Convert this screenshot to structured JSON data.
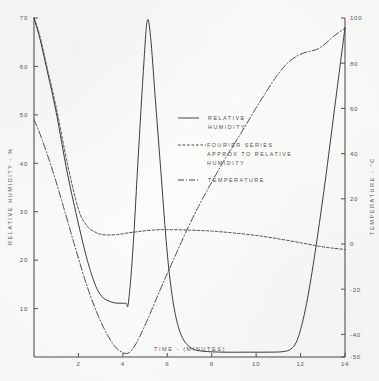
{
  "chart_data": {
    "type": "line",
    "title": "",
    "xlabel": "TIME - (MINUTES)",
    "ylabel": "RELATIVE HUMIDITY - %",
    "y2label": "TEMPERATURE - °C",
    "xlim": [
      0,
      14
    ],
    "ylim": [
      0,
      70
    ],
    "y2lim": [
      -50,
      100
    ],
    "grid": false,
    "legend_position": "center",
    "xticks": [
      2,
      4,
      6,
      8,
      10,
      12,
      14
    ],
    "xticklabels": [
      "2",
      "4",
      "6",
      "8",
      "10",
      "12",
      "14"
    ],
    "yticks": [
      10,
      20,
      30,
      40,
      50,
      60,
      70
    ],
    "yticklabels": [
      "10",
      "20",
      "30",
      "40",
      "50",
      "60",
      "70"
    ],
    "y2ticks": [
      -50,
      -40,
      -20,
      0,
      20,
      40,
      60,
      80,
      100
    ],
    "y2ticklabels": [
      "-50",
      "-40",
      "-20",
      "0",
      "20",
      "40",
      "60",
      "80",
      "100"
    ],
    "series": [
      {
        "name": "RELATIVE HUMIDITY",
        "style": "solid",
        "axis": "left",
        "x": [
          0.0,
          0.25,
          0.6,
          1.0,
          1.5,
          2.0,
          2.4,
          2.75,
          3.0,
          3.25,
          3.6,
          3.95,
          4.15,
          4.25,
          4.45,
          4.7,
          4.95,
          5.1,
          5.25,
          5.45,
          5.7,
          5.95,
          6.15,
          6.4,
          6.7,
          7.1,
          7.6,
          8.5,
          9.5,
          10.5,
          11.2,
          11.55,
          11.8,
          12.05,
          12.35,
          12.7,
          13.1,
          13.55,
          14.0
        ],
        "y": [
          70.0,
          66.0,
          59.0,
          50.5,
          38.0,
          27.5,
          20.0,
          15.0,
          12.8,
          11.8,
          11.2,
          11.1,
          11.1,
          11.2,
          22.0,
          42.0,
          61.0,
          69.5,
          66.0,
          54.0,
          39.0,
          24.0,
          15.0,
          8.0,
          3.8,
          1.8,
          1.2,
          1.0,
          1.0,
          1.0,
          1.1,
          1.6,
          3.0,
          6.5,
          13.0,
          23.0,
          36.0,
          52.0,
          68.0
        ]
      },
      {
        "name": "FOURIER SERIES APPROX TO RELATIVE HUMIDITY",
        "style": "dashed",
        "axis": "left",
        "x": [
          0.0,
          0.25,
          0.6,
          1.0,
          1.5,
          2.0,
          2.4,
          2.75,
          3.05,
          3.4,
          3.8,
          4.2,
          4.7,
          5.3,
          6.0,
          7.0,
          8.0,
          9.0,
          10.0,
          11.0,
          12.0,
          12.8,
          13.4,
          14.0
        ],
        "y": [
          70.0,
          66.5,
          59.5,
          51.5,
          40.0,
          30.5,
          27.0,
          25.8,
          25.3,
          25.2,
          25.3,
          25.6,
          25.9,
          26.2,
          26.3,
          26.2,
          26.0,
          25.6,
          25.1,
          24.4,
          23.6,
          22.9,
          22.5,
          22.2
        ]
      },
      {
        "name": "TEMPERATURE",
        "style": "dash-dot",
        "axis": "right",
        "x": [
          0.0,
          0.2,
          0.55,
          0.95,
          1.4,
          1.9,
          2.4,
          2.9,
          3.35,
          3.7,
          3.95,
          4.15,
          4.35,
          4.6,
          4.95,
          5.35,
          5.8,
          6.3,
          6.85,
          7.4,
          7.95,
          8.5,
          9.0,
          9.5,
          9.95,
          10.4,
          10.9,
          11.4,
          11.9,
          12.3,
          12.7,
          13.1,
          13.5,
          14.0
        ],
        "y": [
          55.0,
          50.5,
          41.0,
          29.0,
          14.0,
          -3.0,
          -19.0,
          -32.0,
          -41.0,
          -46.0,
          -47.8,
          -48.5,
          -47.5,
          -44.0,
          -37.0,
          -28.0,
          -17.5,
          -6.5,
          5.5,
          16.5,
          26.5,
          36.0,
          44.0,
          52.0,
          59.5,
          66.5,
          74.0,
          80.0,
          83.5,
          85.0,
          86.0,
          88.5,
          92.0,
          95.5
        ]
      }
    ],
    "annotations": []
  },
  "legend": {
    "items": [
      {
        "label_line1": "RELATIVE",
        "label_line2": "HUMIDITY",
        "label_line3": "",
        "style": "solid"
      },
      {
        "label_line1": "FOURIER SERIES",
        "label_line2": "APPROX TO RELATIVE",
        "label_line3": "HUMIDITY",
        "style": "dashed"
      },
      {
        "label_line1": "TEMPERATURE",
        "label_line2": "",
        "label_line3": "",
        "style": "dash-dot"
      }
    ]
  },
  "colors": {
    "ink": "#3b3b3b",
    "axis": "#4a4a4a",
    "paper": "#fbfbf9"
  }
}
